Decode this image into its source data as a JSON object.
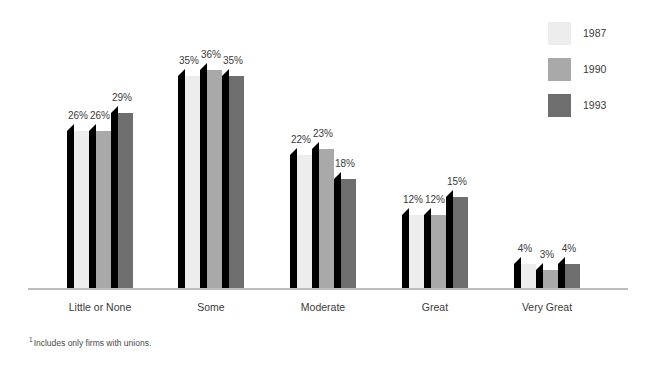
{
  "chart_data": {
    "type": "bar",
    "title": "",
    "subtitle": "",
    "xlabel": "",
    "ylabel": "",
    "grid": false,
    "legend_position": "top-right",
    "ylim": [
      0,
      40
    ],
    "value_suffix": "%",
    "categories": [
      "Little or None",
      "Some",
      "Moderate",
      "Great",
      "Very Great"
    ],
    "series": [
      {
        "name": "1987",
        "color": "#ededed",
        "values": [
          26,
          35,
          22,
          12,
          4
        ]
      },
      {
        "name": "1990",
        "color": "#a9a9a9",
        "values": [
          26,
          36,
          23,
          12,
          3
        ]
      },
      {
        "name": "1993",
        "color": "#6e6e6e",
        "values": [
          29,
          35,
          18,
          15,
          4
        ]
      }
    ],
    "data_labels": [
      [
        "26%",
        "26%",
        "29%"
      ],
      [
        "35%",
        "36%",
        "35%"
      ],
      [
        "22%",
        "23%",
        "18%"
      ],
      [
        "12%",
        "12%",
        "15%"
      ],
      [
        "4%",
        "3%",
        "4%"
      ]
    ],
    "annotations": [
      "Includes only firms with unions."
    ]
  },
  "legend": {
    "items": [
      {
        "label": "1987",
        "color": "#ededed"
      },
      {
        "label": "1990",
        "color": "#a9a9a9"
      },
      {
        "label": "1993",
        "color": "#6e6e6e"
      }
    ]
  },
  "axis": {
    "tick_labels": [
      "Little or None",
      "Some",
      "Moderate",
      "Great",
      "Very Great"
    ]
  },
  "footnote": {
    "marker": "1",
    "text": "Includes only firms with unions."
  },
  "colors": {
    "series_1987": "#ededed",
    "series_1990": "#a9a9a9",
    "series_1993": "#6e6e6e",
    "bar_side_shadow": "#000000",
    "axis_line": "#bdbdbd",
    "text": "#3a3a3a",
    "background": "#ffffff"
  }
}
